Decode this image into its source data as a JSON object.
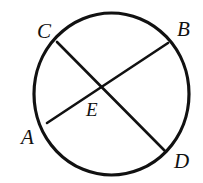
{
  "figure": {
    "kind": "geometry-diagram",
    "canvas": {
      "width": 203,
      "height": 183,
      "background": "#ffffff"
    },
    "stroke_color": "#111111",
    "label_color": "#111111",
    "circle": {
      "center_x": 111.5,
      "center_y": 94,
      "radius_x": 77.5,
      "radius_y": 81,
      "stroke_width": 3.2
    },
    "chords": [
      {
        "name": "chord-ab",
        "from": "A",
        "to": "B",
        "x1": 47,
        "y1": 123,
        "x2": 168,
        "y2": 43,
        "stroke_width": 2.6
      },
      {
        "name": "chord-cd",
        "from": "C",
        "to": "D",
        "x1": 57,
        "y1": 42,
        "x2": 165,
        "y2": 151,
        "stroke_width": 2.6
      }
    ],
    "intersection": {
      "name": "E",
      "x": 103,
      "y": 87
    },
    "labels": [
      {
        "id": "C",
        "text": "C",
        "x": 37,
        "y": 21,
        "role": "vertex"
      },
      {
        "id": "B",
        "text": "B",
        "x": 177,
        "y": 19,
        "role": "vertex"
      },
      {
        "id": "A",
        "text": "A",
        "x": 21,
        "y": 127,
        "role": "vertex"
      },
      {
        "id": "E",
        "text": "E",
        "x": 86,
        "y": 100,
        "role": "interior"
      },
      {
        "id": "D",
        "text": "D",
        "x": 174,
        "y": 151,
        "role": "vertex"
      }
    ]
  }
}
